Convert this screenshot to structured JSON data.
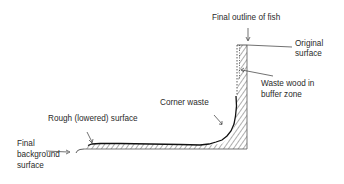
{
  "labels": {
    "final_outline": "Final outline of fish",
    "original_surface_1": "Original",
    "original_surface_2": "surface",
    "waste_wood_1": "Waste wood in",
    "waste_wood_2": "buffer zone",
    "corner_waste": "Corner waste",
    "rough_surface": "Rough (lowered) surface",
    "final_background_1": "Final",
    "final_background_2": "background",
    "final_background_3": "surface"
  },
  "colors": {
    "line": "#1a1a1a",
    "hatch": "#333333",
    "text": "#2a2a2a",
    "background": "#ffffff"
  }
}
